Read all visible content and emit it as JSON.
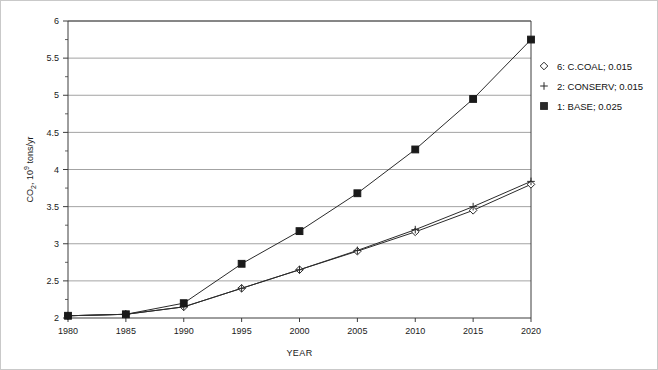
{
  "chart_data": {
    "type": "line",
    "title": "",
    "xlabel": "YEAR",
    "ylabel": "CO2, 10^9 tons/yr",
    "ylabel_parts": {
      "base": "CO",
      "sub": "2",
      "mid": ", 10",
      "sup": "9",
      "tail": " tons/yr"
    },
    "x": [
      1980,
      1985,
      1990,
      1995,
      2000,
      2005,
      2010,
      2015,
      2020
    ],
    "xlim": [
      1980,
      2020
    ],
    "ylim": [
      2,
      6
    ],
    "xticks": [
      "1980",
      "1985",
      "1990",
      "1995",
      "2000",
      "2005",
      "2010",
      "2015",
      "2020"
    ],
    "yticks": [
      "2",
      "2.5",
      "3",
      "3.5",
      "4",
      "4.5",
      "5",
      "5.5",
      "6"
    ],
    "ytick_minor_step": 0.25,
    "grid": "horizontal",
    "legend_position": "right",
    "series": [
      {
        "name": "6: C.COAL; 0.015",
        "label": "6: C.COAL; 0.015",
        "marker": "diamond-open",
        "color": "#2b2b2b",
        "values": [
          2.03,
          2.05,
          2.15,
          2.4,
          2.65,
          2.9,
          3.16,
          3.45,
          3.8
        ]
      },
      {
        "name": "2: CONSERV; 0.015",
        "label": "2: CONSERV; 0.015",
        "marker": "plus",
        "color": "#2b2b2b",
        "values": [
          2.03,
          2.05,
          2.15,
          2.4,
          2.65,
          2.91,
          3.19,
          3.5,
          3.84
        ]
      },
      {
        "name": "1: BASE; 0.025",
        "label": "1: BASE; 0.025",
        "marker": "square-filled",
        "color": "#1a1a1a",
        "values": [
          2.03,
          2.05,
          2.2,
          2.73,
          3.17,
          3.68,
          4.27,
          4.95,
          5.75
        ]
      }
    ]
  },
  "legend": {
    "items": [
      {
        "marker": "diamond-open",
        "label": "6: C.COAL; 0.015"
      },
      {
        "marker": "plus",
        "label": "2: CONSERV; 0.015"
      },
      {
        "marker": "square-filled",
        "label": "1: BASE; 0.025"
      }
    ]
  },
  "colors": {
    "background": "#ffffff",
    "axis": "#3c3c3c",
    "grid": "#8c8c8c",
    "series": "#2b2b2b"
  }
}
